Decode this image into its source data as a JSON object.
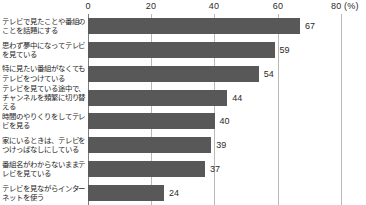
{
  "chart_data": {
    "type": "bar",
    "orientation": "horizontal",
    "title": "",
    "xlabel": "(%)",
    "ylabel": "",
    "xlim": [
      0,
      80
    ],
    "grid": true,
    "legend": false,
    "unit_note": "(%)",
    "xticks": [
      0,
      20,
      40,
      60,
      80
    ],
    "xtick_labels": [
      "0",
      "20",
      "40",
      "60",
      "80 (%)"
    ],
    "categories": [
      "テレビで見たことや番組のことを話題にする",
      "思わず夢中になってテレビを見ている",
      "特に見たい番組がなくてもテレビをつけている",
      "テレビを見ている途中で、チャンネルを頻繁に切り替える",
      "時間のやりくりをしてテレビを見る",
      "家にいるときは、テレビをつけっぱなしにしている",
      "番組名がわからないままテレビを見ている",
      "テレビを見ながらインターネットを使う"
    ],
    "values": [
      67,
      59,
      54,
      44,
      40,
      39,
      37,
      24
    ],
    "value_labels": [
      "67",
      "59",
      "54",
      "44",
      "40",
      "39",
      "37",
      "24"
    ],
    "bar_color": "#585858",
    "grid_color": "#b9b9b9",
    "axis_color": "#7d7d7d",
    "text_color": "#1e1e1e"
  }
}
